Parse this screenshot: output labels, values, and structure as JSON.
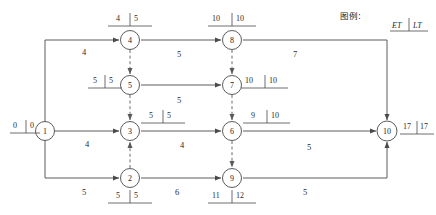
{
  "diagram": {
    "type": "aoe-activity-network",
    "legend": {
      "title": "图例:",
      "et_label": "ET",
      "lt_label": "LT"
    },
    "nodes": [
      {
        "id": "1",
        "label": "1",
        "x": 45,
        "y": 131,
        "et": "0",
        "lt": "0",
        "marker_side": "left",
        "marker_x": 14,
        "marker_y": 124
      },
      {
        "id": "2",
        "label": "2",
        "x": 130,
        "y": 178,
        "et": "5",
        "lt": "5",
        "marker_side": "below",
        "marker_x": 113,
        "marker_y": 196
      },
      {
        "id": "3",
        "label": "3",
        "x": 130,
        "y": 131,
        "et": "5",
        "lt": "5",
        "marker_side": "right",
        "marker_x": 146,
        "marker_y": 114
      },
      {
        "id": "4",
        "label": "4",
        "x": 130,
        "y": 40,
        "et": "4",
        "lt": "5",
        "marker_side": "above",
        "marker_x": 113,
        "marker_y": 16
      },
      {
        "id": "5",
        "label": "5",
        "x": 130,
        "y": 85,
        "et": "5",
        "lt": "5",
        "marker_side": "left",
        "marker_x": 94,
        "marker_y": 79
      },
      {
        "id": "6",
        "label": "6",
        "x": 232,
        "y": 131,
        "et": "9",
        "lt": "10",
        "marker_side": "right",
        "marker_x": 248,
        "marker_y": 114
      },
      {
        "id": "7",
        "label": "7",
        "x": 232,
        "y": 85,
        "et": "10",
        "lt": "10",
        "marker_side": "right",
        "marker_x": 245,
        "marker_y": 79
      },
      {
        "id": "8",
        "label": "8",
        "x": 232,
        "y": 40,
        "et": "10",
        "lt": "10",
        "marker_side": "above",
        "marker_x": 212,
        "marker_y": 16
      },
      {
        "id": "9",
        "label": "9",
        "x": 232,
        "y": 178,
        "et": "11",
        "lt": "12",
        "marker_side": "below",
        "marker_x": 212,
        "marker_y": 196
      },
      {
        "id": "10",
        "label": "10",
        "x": 387,
        "y": 131,
        "et": "17",
        "lt": "17",
        "marker_side": "right",
        "marker_x": 404,
        "marker_y": 125
      }
    ],
    "edges": [
      {
        "from": "1",
        "to": "4",
        "weight": "4",
        "wx": 82,
        "wy": 48,
        "style": "solid"
      },
      {
        "from": "1",
        "to": "3",
        "weight": "4",
        "wx": 85,
        "wy": 142,
        "style": "solid"
      },
      {
        "from": "1",
        "to": "2",
        "weight": "5",
        "wx": 82,
        "wy": 188,
        "style": "solid"
      },
      {
        "from": "4",
        "to": "8",
        "weight": "5",
        "wx": 177,
        "wy": 51,
        "style": "solid"
      },
      {
        "from": "5",
        "to": "7",
        "weight": "5",
        "wx": 177,
        "wy": 98,
        "style": "solid"
      },
      {
        "from": "3",
        "to": "6",
        "weight": "4",
        "wx": 180,
        "wy": 145,
        "style": "solid"
      },
      {
        "from": "2",
        "to": "9",
        "weight": "6",
        "wx": 175,
        "wy": 190,
        "style": "solid"
      },
      {
        "from": "8",
        "to": "10",
        "weight": "7",
        "wx": 293,
        "wy": 51,
        "style": "solid"
      },
      {
        "from": "6",
        "to": "10",
        "weight": "5",
        "wx": 307,
        "wy": 146,
        "style": "solid"
      },
      {
        "from": "9",
        "to": "10",
        "weight": "5",
        "wx": 303,
        "wy": 190,
        "style": "solid"
      },
      {
        "from": "4",
        "to": "5",
        "weight": "",
        "wx": 0,
        "wy": 0,
        "style": "dashed"
      },
      {
        "from": "5",
        "to": "3",
        "weight": "",
        "wx": 0,
        "wy": 0,
        "style": "dashed"
      },
      {
        "from": "2",
        "to": "3",
        "weight": "",
        "wx": 0,
        "wy": 0,
        "style": "dashed"
      },
      {
        "from": "8",
        "to": "7",
        "weight": "",
        "wx": 0,
        "wy": 0,
        "style": "dashed"
      },
      {
        "from": "7",
        "to": "6",
        "weight": "",
        "wx": 0,
        "wy": 0,
        "style": "dashed"
      },
      {
        "from": "6",
        "to": "9",
        "weight": "",
        "wx": 0,
        "wy": 0,
        "style": "dashed"
      }
    ],
    "colors": {
      "line": "#4a4a4a",
      "dashed": "#5a5a5a",
      "text": "#2b2b2b",
      "background": "#ffffff"
    }
  }
}
